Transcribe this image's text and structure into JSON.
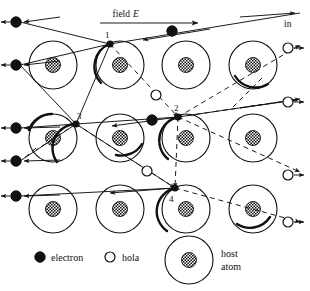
{
  "figure": {
    "name": "impact-ionization-avalanche-diagram",
    "width": 310,
    "height": 291,
    "background": "#ffffff",
    "ink": "#111111"
  },
  "annotations": {
    "field_label_text": "field",
    "field_label_symbol": "E",
    "incoming_label": "in",
    "collision_numbers": [
      "1",
      "2",
      "3",
      "4"
    ]
  },
  "legend": {
    "electron_label": "electron",
    "hole_label": "hola",
    "host_line1": "host",
    "host_line2": "atom"
  },
  "lattice": {
    "rows": 3,
    "cols": 4,
    "atom_radius": 24,
    "nucleus_radius": 7.5,
    "col_x": [
      53,
      120,
      186,
      253
    ],
    "row_y": [
      65,
      138,
      209
    ]
  },
  "particles": {
    "electrons_left": [
      {
        "x": 16,
        "y": 22
      },
      {
        "x": 16,
        "y": 65
      },
      {
        "x": 16,
        "y": 128
      },
      {
        "x": 16,
        "y": 161
      },
      {
        "x": 16,
        "y": 196
      }
    ],
    "electrons_inner": [
      {
        "x": 172,
        "y": 31
      },
      {
        "x": 152,
        "y": 120
      }
    ],
    "holes_inner": [
      {
        "x": 156,
        "y": 95
      },
      {
        "x": 147,
        "y": 171
      }
    ],
    "holes_right": [
      {
        "x": 288,
        "y": 48
      },
      {
        "x": 288,
        "y": 102
      },
      {
        "x": 288,
        "y": 175
      },
      {
        "x": 288,
        "y": 222
      }
    ],
    "collision_points": [
      {
        "id": "1",
        "x": 110,
        "y": 44
      },
      {
        "id": "2",
        "x": 178,
        "y": 117
      },
      {
        "id": "3",
        "x": 76,
        "y": 124
      },
      {
        "id": "4",
        "x": 175,
        "y": 188
      }
    ]
  },
  "colors": {
    "electron_fill": "#111111",
    "hole_fill": "#ffffff",
    "stroke": "#111111",
    "nucleus_pattern": "cross-hatch"
  }
}
